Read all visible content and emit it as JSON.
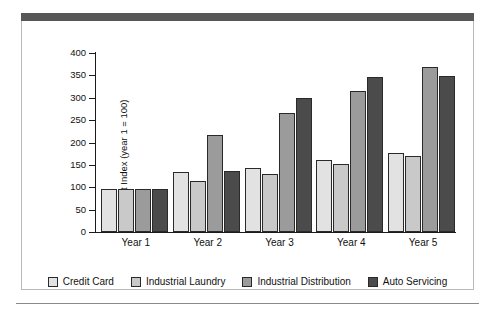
{
  "figure": {
    "header_bar_color": "#575757",
    "frame_border_color": "#b9b9b9",
    "background_color": "#ffffff"
  },
  "chart_data": {
    "type": "bar",
    "title": "",
    "subtitle": "",
    "xlabel": "",
    "ylabel": "Profit Index (year 1 = 100)",
    "categories": [
      "Year 1",
      "Year 2",
      "Year 3",
      "Year 4",
      "Year 5"
    ],
    "series": [
      {
        "name": "Credit Card",
        "color": "#e2e2e2",
        "values": [
          96,
          135,
          143,
          160,
          176
        ]
      },
      {
        "name": "Industrial Laundry",
        "color": "#c9c9c9",
        "values": [
          96,
          113,
          130,
          151,
          170
        ]
      },
      {
        "name": "Industrial Distribution",
        "color": "#9b9b9b",
        "values": [
          96,
          216,
          265,
          315,
          368
        ]
      },
      {
        "name": "Auto Servicing",
        "color": "#4b4b4b",
        "values": [
          96,
          137,
          300,
          347,
          348
        ]
      }
    ],
    "ylim": [
      0,
      400
    ],
    "yticks": [
      0,
      50,
      100,
      150,
      200,
      250,
      300,
      350,
      400
    ],
    "ytick_labels": [
      "0",
      "50",
      "100",
      "150",
      "200",
      "250",
      "300",
      "350",
      "400"
    ],
    "grid": false,
    "legend_position": "bottom"
  }
}
